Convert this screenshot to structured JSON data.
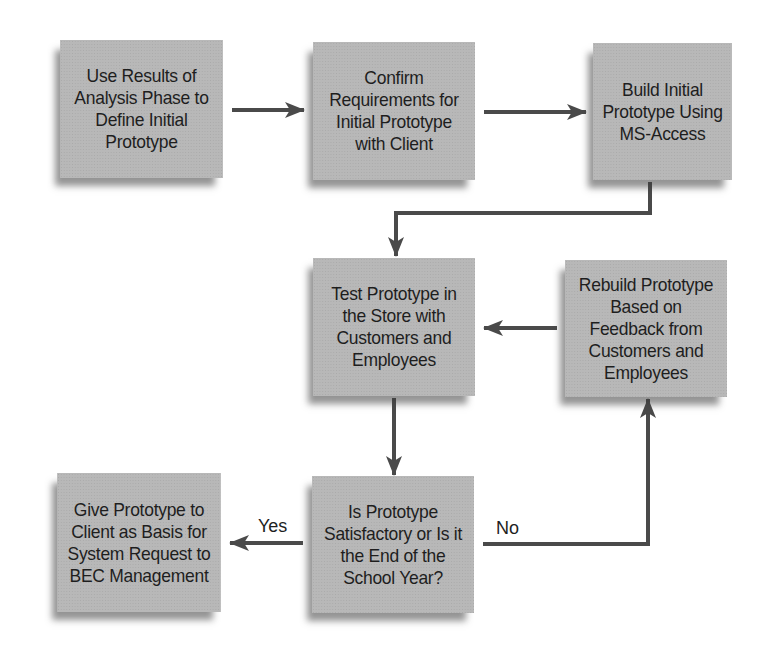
{
  "diagram": {
    "type": "flowchart",
    "nodes": [
      {
        "id": "analysis",
        "label": "Use Results of\nAnalysis Phase to\nDefine Initial\nPrototype"
      },
      {
        "id": "confirm",
        "label": "Confirm\nRequirements for\nInitial Prototype\nwith Client"
      },
      {
        "id": "build",
        "label": "Build Initial\nPrototype Using\nMS-Access"
      },
      {
        "id": "test",
        "label": "Test Prototype in\nthe Store with\nCustomers and\nEmployees"
      },
      {
        "id": "rebuild",
        "label": "Rebuild Prototype\nBased on\nFeedback from\nCustomers and\nEmployees"
      },
      {
        "id": "decision",
        "label": "Is Prototype\nSatisfactory or Is it\nthe End of the\nSchool Year?"
      },
      {
        "id": "give",
        "label": "Give Prototype to\nClient as Basis for\nSystem Request to\nBEC Management"
      }
    ],
    "edges": [
      {
        "from": "analysis",
        "to": "confirm",
        "label": ""
      },
      {
        "from": "confirm",
        "to": "build",
        "label": ""
      },
      {
        "from": "build",
        "to": "test",
        "label": ""
      },
      {
        "from": "rebuild",
        "to": "test",
        "label": ""
      },
      {
        "from": "test",
        "to": "decision",
        "label": ""
      },
      {
        "from": "decision",
        "to": "give",
        "label": "Yes"
      },
      {
        "from": "decision",
        "to": "rebuild",
        "label": "No"
      }
    ],
    "colors": {
      "box_fill": "#b8b8b8",
      "arrow": "#4a4a4a",
      "text": "#1e1e1e",
      "background": "#ffffff"
    }
  }
}
